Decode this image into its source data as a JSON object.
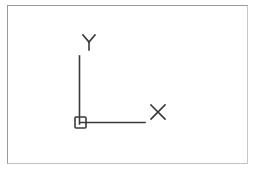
{
  "diagram": {
    "type": "ucs-icon",
    "x_axis_label": "X",
    "y_axis_label": "Y",
    "colors": {
      "stroke": "#3a3a3a",
      "frame": "#9a9a9a",
      "background": "#ffffff"
    }
  }
}
